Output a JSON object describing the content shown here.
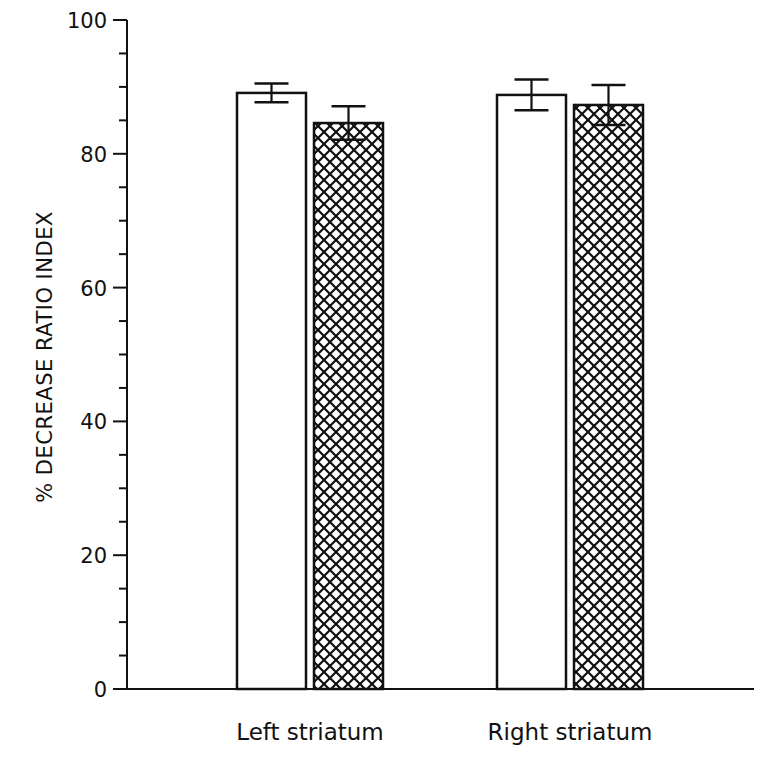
{
  "chart_data": {
    "type": "bar",
    "title": "",
    "xlabel": "",
    "ylabel": "% DECREASE RATIO INDEX",
    "ylim": [
      0,
      100
    ],
    "yticks": [
      0,
      20,
      40,
      60,
      80,
      100
    ],
    "yticklabels": [
      "0",
      "20",
      "40",
      "60",
      "80",
      "100"
    ],
    "minor_tick_step": 5,
    "grid": false,
    "legend": null,
    "categories": [
      "Left striatum",
      "Right striatum"
    ],
    "series": [
      {
        "name": "Group 1 (open)",
        "fill": "open",
        "values": [
          89.1,
          88.8
        ],
        "errors": [
          1.4,
          2.3
        ]
      },
      {
        "name": "Group 2 (crosshatched)",
        "fill": "crosshatch",
        "values": [
          84.6,
          87.3
        ],
        "errors": [
          2.5,
          3.0
        ]
      }
    ]
  }
}
